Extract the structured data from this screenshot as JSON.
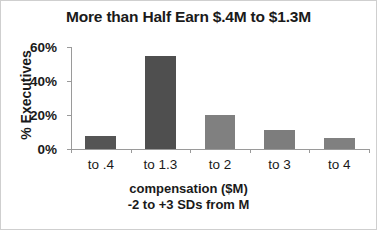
{
  "chart_data": {
    "type": "bar",
    "title": "More than Half Earn $.4M to $1.3M",
    "categories": [
      "to .4",
      "to 1.3",
      "to 2",
      "to 3",
      "to 4"
    ],
    "values": [
      7.5,
      55,
      20,
      11,
      6.5
    ],
    "value_labels": [
      "7.5%",
      "55%",
      "20%",
      "11%",
      "6.5%"
    ],
    "bar_colors": [
      "#555555",
      "#4f4f4f",
      "#808080",
      "#7d7d7d",
      "#808080"
    ],
    "xlabel": "compensation ($M)",
    "xlabel_line2": "-2 to +3 SDs from M",
    "ylabel": "% Executives",
    "ylim": [
      0,
      60
    ],
    "yticks": [
      0,
      20,
      40,
      60
    ],
    "ytick_labels": [
      "0%",
      "20%",
      "40%",
      "60%"
    ],
    "grid": false,
    "legend": "none"
  }
}
